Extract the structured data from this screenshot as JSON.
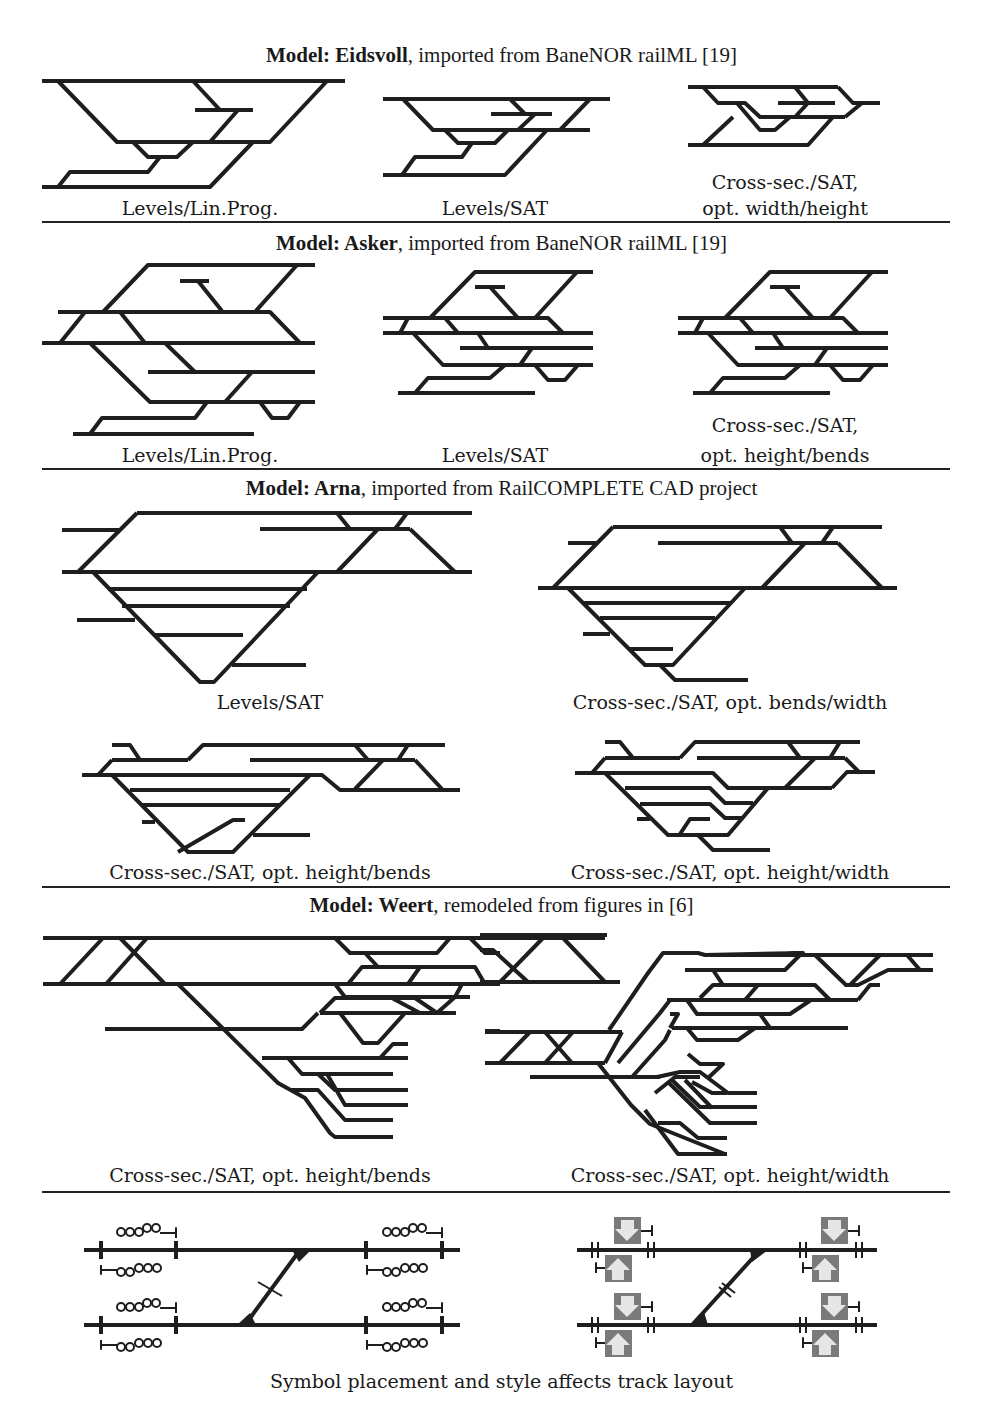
{
  "sections": [
    {
      "title_bold": "Model: Eidsvoll",
      "title_rest": ", imported from BaneNOR railML [19]",
      "captions": [
        "Levels/Lin.Prog.",
        "Levels/SAT",
        "Cross-sec./SAT,",
        "opt. width/height"
      ]
    },
    {
      "title_bold": "Model: Asker",
      "title_rest": ", imported from BaneNOR railML [19]",
      "captions": [
        "Levels/Lin.Prog.",
        "Levels/SAT",
        "Cross-sec./SAT,",
        "opt. height/bends"
      ]
    },
    {
      "title_bold": "Model: Arna",
      "title_rest": ", imported from RailCOMPLETE CAD project",
      "captions": [
        "Levels/SAT",
        "Cross-sec./SAT, opt. bends/width",
        "Cross-sec./SAT, opt. height/bends",
        "Cross-sec./SAT, opt. height/width"
      ]
    },
    {
      "title_bold": "Model: Weert",
      "title_rest": ", remodeled from figures in [6]",
      "captions": [
        "Cross-sec./SAT, opt. height/bends",
        "Cross-sec./SAT, opt. height/width"
      ]
    },
    {
      "captions": [
        "Symbol placement and style affects track layout"
      ]
    }
  ],
  "colors": {
    "track": "#1e1e1e",
    "rule": "#222222",
    "signal_box": "#7a7a7a",
    "signal_arrow": "#e6e6e6"
  }
}
